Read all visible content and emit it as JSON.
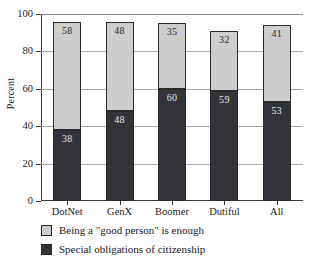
{
  "chart_data": {
    "type": "bar",
    "subtype": "stacked-bar",
    "title": "",
    "xlabel": "",
    "ylabel": "Percent",
    "ylim": [
      0,
      100
    ],
    "yticks": [
      0,
      20,
      40,
      60,
      80,
      100
    ],
    "grid": true,
    "legend_position": "below",
    "categories": [
      "DotNet",
      "GenX",
      "Boomer",
      "Dutiful",
      "All"
    ],
    "series": [
      {
        "name": "Special obligations of citizenship",
        "color": "#33333a",
        "values": [
          38,
          48,
          60,
          59,
          53
        ]
      },
      {
        "name": "Being a \"good person\" is enough",
        "color": "#cdcdcd",
        "values": [
          58,
          48,
          35,
          32,
          41
        ]
      }
    ]
  },
  "axis": {
    "y_title": "Percent",
    "y_tick_labels": [
      "0",
      "20",
      "40",
      "60",
      "80",
      "100"
    ],
    "x_tick_labels": [
      "DotNet",
      "GenX",
      "Boomer",
      "Dutiful",
      "All"
    ]
  },
  "bar_value_labels": {
    "upper": [
      "58",
      "48",
      "35",
      "32",
      "41"
    ],
    "lower": [
      "38",
      "48",
      "60",
      "59",
      "53"
    ]
  },
  "legend": {
    "items": [
      {
        "label": "Being a \"good person\" is enough",
        "swatch": "light"
      },
      {
        "label": "Special obligations of citizenship",
        "swatch": "dark"
      }
    ]
  }
}
